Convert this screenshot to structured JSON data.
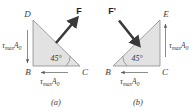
{
  "figure": {
    "type": "engineering-free-body-diagram",
    "fill_color": "#e2e2e2",
    "stroke_color": "#8a8a8a",
    "text_color": "#3d3d3d",
    "force_color": "#3a3a3a"
  },
  "panel_a": {
    "caption": "(a)",
    "vertices": {
      "top_left": "D",
      "bottom_left": "B",
      "bottom_right": "C"
    },
    "angle_label": "45°",
    "force_label": "F",
    "shear_left": {
      "symbol": "τ",
      "sub": "max",
      "area": "A",
      "area_sub": "0",
      "direction": "down"
    },
    "shear_bottom": {
      "symbol": "τ",
      "sub": "max",
      "area": "A",
      "area_sub": "0",
      "direction": "left"
    }
  },
  "panel_b": {
    "caption": "(b)",
    "vertices": {
      "top_right": "E",
      "bottom_left": "B",
      "bottom_right": "C"
    },
    "angle_label": "45°",
    "force_label": "F'",
    "shear_right": {
      "symbol": "τ",
      "sub": "max",
      "area": "A",
      "area_sub": "0",
      "direction": "up"
    },
    "shear_bottom": {
      "symbol": "τ",
      "sub": "max",
      "area": "A",
      "area_sub": "0",
      "direction": "left"
    }
  }
}
